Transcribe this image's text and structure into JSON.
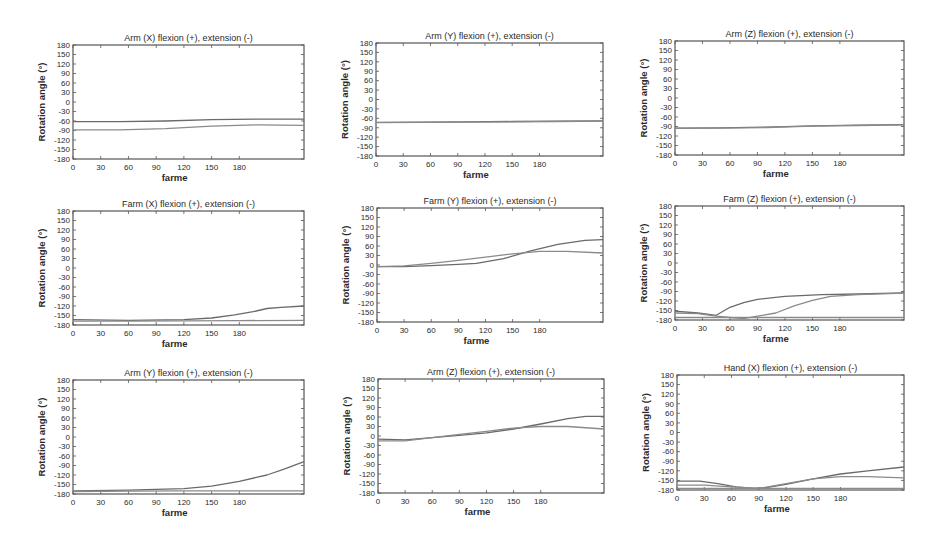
{
  "figure": {
    "axis_color": "#555555",
    "line_color": "#6a6a6a",
    "line_color_alt": "#8a8a8a",
    "background": "#ffffff"
  },
  "chart_data": [
    {
      "type": "line",
      "title": "Arm (X) flexion (+), extension (-)",
      "xlabel": "farme",
      "ylabel": "Rotation angle (°)",
      "xlim": [
        0,
        250
      ],
      "ylim": [
        -180,
        180
      ],
      "xticks": [
        0,
        30,
        60,
        90,
        120,
        150,
        180
      ],
      "yticks": [
        180,
        150,
        120,
        90,
        60,
        30,
        0,
        -30,
        -60,
        -90,
        -120,
        -150,
        -180
      ],
      "grid": false,
      "box": {
        "x": 73,
        "y": 45,
        "w": 231,
        "h": 114
      },
      "series": [
        {
          "name": "series-1",
          "x": [
            0,
            50,
            100,
            150,
            200,
            250
          ],
          "y": [
            -62,
            -62,
            -60,
            -56,
            -54,
            -54
          ]
        },
        {
          "name": "series-2",
          "x": [
            0,
            50,
            100,
            150,
            200,
            250
          ],
          "y": [
            -88,
            -88,
            -84,
            -76,
            -72,
            -74
          ]
        }
      ]
    },
    {
      "type": "line",
      "title": "Arm (Y) flexion (+), extension (-)",
      "xlabel": "farme",
      "ylabel": "Rotation angle (°)",
      "xlim": [
        0,
        250
      ],
      "ylim": [
        -180,
        180
      ],
      "xticks": [
        0,
        30,
        60,
        90,
        120,
        150,
        180
      ],
      "yticks": [
        180,
        150,
        120,
        90,
        60,
        30,
        0,
        -30,
        -60,
        -90,
        -120,
        -150,
        -180
      ],
      "grid": false,
      "box": {
        "x": 376,
        "y": 43,
        "w": 227,
        "h": 113
      },
      "series": [
        {
          "name": "series-1",
          "x": [
            0,
            50,
            100,
            150,
            200,
            250
          ],
          "y": [
            -73,
            -72,
            -71,
            -70,
            -69,
            -68
          ]
        },
        {
          "name": "series-2",
          "x": [
            0,
            50,
            100,
            150,
            200,
            250
          ],
          "y": [
            -74,
            -73,
            -72,
            -71,
            -70,
            -69
          ]
        }
      ]
    },
    {
      "type": "line",
      "title": "Arm (Z) flexion (+), extension (-)",
      "xlabel": "farme",
      "ylabel": "Rotation angle (°)",
      "xlim": [
        0,
        250
      ],
      "ylim": [
        -180,
        180
      ],
      "xticks": [
        0,
        30,
        60,
        90,
        120,
        150,
        180
      ],
      "yticks": [
        180,
        150,
        120,
        90,
        60,
        30,
        0,
        -30,
        -60,
        -90,
        -120,
        -150,
        -180
      ],
      "grid": false,
      "box": {
        "x": 675,
        "y": 41,
        "w": 229,
        "h": 114
      },
      "series": [
        {
          "name": "series-1",
          "x": [
            0,
            50,
            100,
            150,
            200,
            250
          ],
          "y": [
            -95,
            -94,
            -92,
            -88,
            -86,
            -84
          ]
        },
        {
          "name": "series-2",
          "x": [
            0,
            50,
            100,
            150,
            200,
            250
          ],
          "y": [
            -96,
            -95,
            -93,
            -89,
            -87,
            -85
          ]
        }
      ]
    },
    {
      "type": "line",
      "title": "Farm (X) flexion (+), extension (-)",
      "xlabel": "farme",
      "ylabel": "Rotation angle (°)",
      "xlim": [
        0,
        250
      ],
      "ylim": [
        -180,
        180
      ],
      "xticks": [
        0,
        30,
        60,
        90,
        120,
        150,
        180
      ],
      "yticks": [
        180,
        150,
        120,
        90,
        60,
        30,
        0,
        -30,
        -60,
        -90,
        -120,
        -150,
        -180
      ],
      "grid": false,
      "box": {
        "x": 73,
        "y": 211,
        "w": 231,
        "h": 114
      },
      "series": [
        {
          "name": "series-1",
          "x": [
            0,
            60,
            120,
            150,
            175,
            195,
            210,
            225,
            250
          ],
          "y": [
            -163,
            -165,
            -163,
            -158,
            -148,
            -138,
            -128,
            -124,
            -120
          ]
        },
        {
          "name": "series-2",
          "x": [
            0,
            60,
            120,
            180,
            250
          ],
          "y": [
            -168,
            -168,
            -167,
            -166,
            -165
          ]
        }
      ]
    },
    {
      "type": "line",
      "title": "Farm (Y) flexion (+), extension (-)",
      "xlabel": "farme",
      "ylabel": "Rotation angle (°)",
      "xlim": [
        0,
        250
      ],
      "ylim": [
        -180,
        180
      ],
      "xticks": [
        0,
        30,
        60,
        90,
        120,
        150,
        180
      ],
      "yticks": [
        180,
        150,
        120,
        90,
        60,
        30,
        0,
        -30,
        -60,
        -90,
        -120,
        -150,
        -180
      ],
      "grid": false,
      "box": {
        "x": 377,
        "y": 208,
        "w": 226,
        "h": 114
      },
      "series": [
        {
          "name": "series-1",
          "x": [
            0,
            30,
            60,
            90,
            110,
            140,
            170,
            200,
            230,
            250
          ],
          "y": [
            -5,
            -5,
            -2,
            2,
            5,
            20,
            45,
            65,
            78,
            80
          ]
        },
        {
          "name": "series-2",
          "x": [
            0,
            30,
            60,
            90,
            120,
            150,
            180,
            210,
            250
          ],
          "y": [
            -5,
            -3,
            5,
            15,
            25,
            35,
            43,
            43,
            38
          ]
        }
      ]
    },
    {
      "type": "line",
      "title": "Farm (Z) flexion (+), extension (-)",
      "xlabel": "farme",
      "ylabel": "Rotation angle (°)",
      "xlim": [
        0,
        250
      ],
      "ylim": [
        -180,
        180
      ],
      "xticks": [
        0,
        30,
        60,
        90,
        120,
        150,
        180
      ],
      "yticks": [
        180,
        150,
        120,
        90,
        60,
        30,
        0,
        -30,
        -60,
        -90,
        -120,
        -150,
        -180
      ],
      "grid": false,
      "box": {
        "x": 675,
        "y": 206,
        "w": 229,
        "h": 114
      },
      "series": [
        {
          "name": "series-1",
          "x": [
            0,
            25,
            45,
            60,
            75,
            90,
            120,
            160,
            200,
            250
          ],
          "y": [
            -152,
            -158,
            -165,
            -140,
            -125,
            -115,
            -105,
            -100,
            -98,
            -94
          ]
        },
        {
          "name": "series-2",
          "x": [
            0,
            25,
            45,
            60,
            75,
            90,
            110,
            130,
            150,
            170,
            200,
            250
          ],
          "y": [
            -158,
            -160,
            -168,
            -172,
            -176,
            -168,
            -158,
            -135,
            -118,
            -105,
            -100,
            -95
          ]
        },
        {
          "name": "baseline",
          "x": [
            0,
            250
          ],
          "y": [
            -172,
            -172
          ]
        }
      ]
    },
    {
      "type": "line",
      "title": "Arm (Y) flexion (+), extension (-)",
      "xlabel": "farme",
      "ylabel": "Rotation angle (°)",
      "xlim": [
        0,
        250
      ],
      "ylim": [
        -180,
        180
      ],
      "xticks": [
        0,
        30,
        60,
        90,
        120,
        150,
        180
      ],
      "yticks": [
        180,
        150,
        120,
        90,
        60,
        30,
        0,
        -30,
        -60,
        -90,
        -120,
        -150,
        -180
      ],
      "grid": false,
      "box": {
        "x": 73,
        "y": 380,
        "w": 231,
        "h": 114
      },
      "series": [
        {
          "name": "series-1",
          "x": [
            0,
            60,
            120,
            150,
            180,
            210,
            230,
            250
          ],
          "y": [
            -170,
            -168,
            -163,
            -155,
            -140,
            -120,
            -100,
            -78
          ]
        },
        {
          "name": "series-2",
          "x": [
            0,
            60,
            120,
            180,
            250
          ],
          "y": [
            -172,
            -171,
            -170,
            -170,
            -170
          ]
        }
      ]
    },
    {
      "type": "line",
      "title": "Arm (Z) flexion (+), extension (-)",
      "xlabel": "farme",
      "ylabel": "Rotation angle (°)",
      "xlim": [
        0,
        250
      ],
      "ylim": [
        -180,
        180
      ],
      "xticks": [
        0,
        30,
        60,
        90,
        120,
        150,
        180
      ],
      "yticks": [
        180,
        150,
        120,
        90,
        60,
        30,
        0,
        -30,
        -60,
        -90,
        -120,
        -150,
        -180
      ],
      "grid": false,
      "box": {
        "x": 378,
        "y": 379,
        "w": 226,
        "h": 114
      },
      "series": [
        {
          "name": "series-1",
          "x": [
            0,
            30,
            60,
            90,
            120,
            150,
            180,
            210,
            230,
            250
          ],
          "y": [
            -10,
            -12,
            -5,
            2,
            10,
            22,
            38,
            55,
            62,
            62
          ]
        },
        {
          "name": "series-2",
          "x": [
            0,
            30,
            60,
            90,
            120,
            150,
            180,
            210,
            250
          ],
          "y": [
            -15,
            -15,
            -5,
            5,
            15,
            25,
            30,
            30,
            22
          ]
        }
      ]
    },
    {
      "type": "line",
      "title": "Hand (X) flexion (+), extension (-)",
      "xlabel": "farme",
      "ylabel": "Rotation angle (°)",
      "xlim": [
        0,
        250
      ],
      "ylim": [
        -180,
        180
      ],
      "xticks": [
        0,
        30,
        60,
        90,
        120,
        150,
        180
      ],
      "yticks": [
        180,
        150,
        120,
        90,
        60,
        30,
        0,
        -30,
        -60,
        -90,
        -120,
        -150,
        -180
      ],
      "grid": false,
      "box": {
        "x": 677,
        "y": 375,
        "w": 227,
        "h": 115
      },
      "series": [
        {
          "name": "series-1",
          "x": [
            0,
            25,
            45,
            65,
            85,
            100,
            120,
            150,
            180,
            210,
            250
          ],
          "y": [
            -152,
            -152,
            -160,
            -170,
            -175,
            -172,
            -162,
            -145,
            -130,
            -120,
            -108
          ]
        },
        {
          "name": "series-2",
          "x": [
            0,
            30,
            60,
            90,
            120,
            150,
            180,
            210,
            250
          ],
          "y": [
            -165,
            -165,
            -170,
            -175,
            -160,
            -145,
            -138,
            -138,
            -142
          ]
        },
        {
          "name": "baseline",
          "x": [
            0,
            250
          ],
          "y": [
            -175,
            -175
          ]
        }
      ]
    }
  ]
}
